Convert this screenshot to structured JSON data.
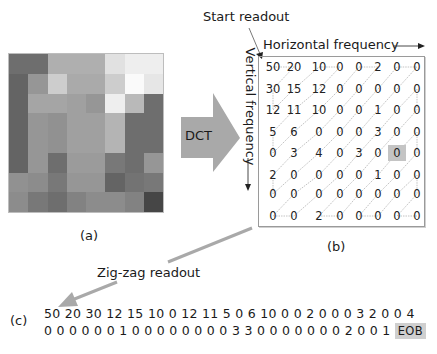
{
  "labels": {
    "start_readout": "Start readout",
    "horizontal_frequency": "Horizontal frequency",
    "vertical_frequency": "Vertical frequency",
    "dct": "DCT",
    "panel_a": "(a)",
    "panel_b": "(b)",
    "panel_c": "(c)",
    "zigzag_readout": "Zig-zag readout"
  },
  "pixel_block": {
    "rows": 8,
    "cols": 8,
    "gray_levels": [
      [
        110,
        110,
        175,
        175,
        175,
        225,
        238,
        238
      ],
      [
        100,
        150,
        205,
        170,
        170,
        205,
        250,
        230
      ],
      [
        100,
        165,
        165,
        160,
        150,
        238,
        185,
        110
      ],
      [
        100,
        150,
        145,
        160,
        160,
        180,
        110,
        110
      ],
      [
        100,
        150,
        145,
        160,
        160,
        180,
        110,
        110
      ],
      [
        100,
        150,
        110,
        155,
        155,
        120,
        110,
        150
      ],
      [
        145,
        140,
        120,
        150,
        150,
        100,
        115,
        120
      ],
      [
        140,
        120,
        110,
        130,
        140,
        140,
        130,
        70
      ]
    ]
  },
  "dct_matrix": {
    "values": [
      [
        "50",
        "20",
        "10",
        "0",
        "0",
        "2",
        "0",
        "0"
      ],
      [
        "30",
        "15",
        "12",
        "0",
        "0",
        "0",
        "0",
        "0"
      ],
      [
        "12",
        "11",
        "10",
        "0",
        "0",
        "1",
        "0",
        "0"
      ],
      [
        "5",
        "6",
        "0",
        "0",
        "0",
        "3",
        "0",
        "0"
      ],
      [
        "0",
        "3",
        "4",
        "0",
        "3",
        "0",
        "0",
        "0"
      ],
      [
        "2",
        "0",
        "0",
        "0",
        "0",
        "1",
        "0",
        "0"
      ],
      [
        "0",
        "0",
        "0",
        "0",
        "0",
        "0",
        "0",
        "0"
      ],
      [
        "0",
        "0",
        "2",
        "0",
        "0",
        "0",
        "0",
        "0"
      ]
    ],
    "highlight": {
      "row": 4,
      "col": 6
    }
  },
  "zigzag_sequence": {
    "line1": "50 20 30 12 15 10 0 12 11 5 0 6 10  0 0 2 0 0 0 3 2 0 0 4",
    "line2": "0 0 0 0 0 0 1 0 0 0 0 0 0 0 0 3 3 0 0 0 0 0 0 0 2 0 0 1",
    "end_marker": "EOB"
  },
  "colors": {
    "arrow_gray": "#a9a9a9",
    "highlight_gray": "#c4c4c4",
    "text": "#1a1a1a"
  }
}
